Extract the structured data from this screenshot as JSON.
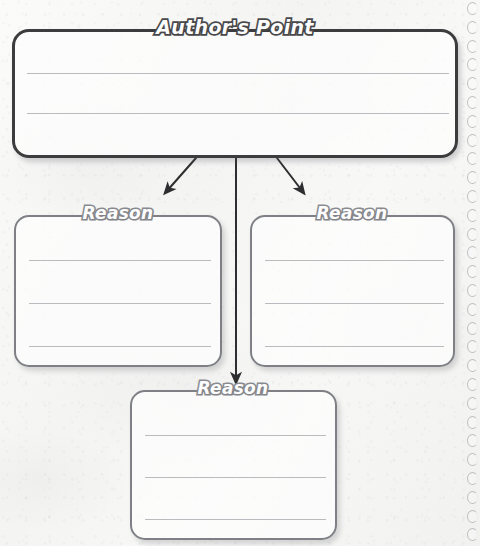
{
  "worksheet": {
    "type": "graphic-organizer",
    "background_color": "#f5f5f4",
    "paper_style": "spiral-bound-notebook"
  },
  "main_box": {
    "title": "Author's Point",
    "title_color": "#fdfdfd",
    "border_color": "#3c3c3e",
    "line_count": 2,
    "x": 12,
    "y": 29,
    "width": 446,
    "height": 129
  },
  "reason_boxes": [
    {
      "id": "reason-left",
      "title": "Reason",
      "border_color": "#7e8085",
      "line_count": 3,
      "x": 14,
      "y": 215,
      "width": 208,
      "height": 152
    },
    {
      "id": "reason-right",
      "title": "Reason",
      "border_color": "#7e8085",
      "line_count": 3,
      "x": 250,
      "y": 215,
      "width": 205,
      "height": 152
    },
    {
      "id": "reason-bottom",
      "title": "Reason",
      "border_color": "#7e8085",
      "line_count": 3,
      "x": 130,
      "y": 390,
      "width": 207,
      "height": 150
    }
  ],
  "connectors": [
    {
      "id": "arrow-left",
      "from": "main_box",
      "to": "reason-left",
      "direction": "down-left",
      "color": "#2e2e30"
    },
    {
      "id": "arrow-center",
      "from": "main_box",
      "to": "reason-bottom",
      "direction": "down",
      "color": "#2e2e30"
    },
    {
      "id": "arrow-right",
      "from": "main_box",
      "to": "reason-right",
      "direction": "down-right",
      "color": "#2e2e30"
    }
  ],
  "spiral": {
    "hole_count": 29,
    "spacing": 18.8,
    "start_y": 2,
    "color": "#737680"
  }
}
